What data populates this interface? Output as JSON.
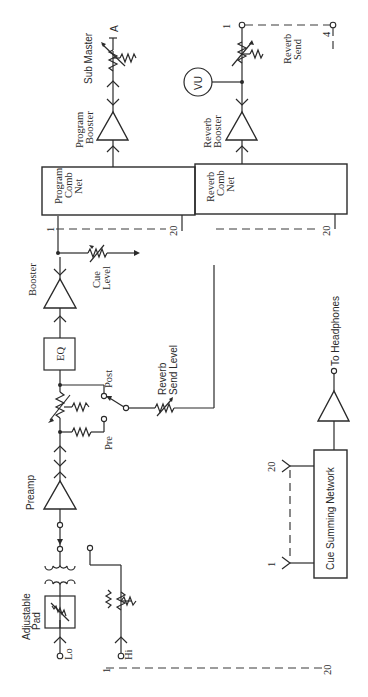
{
  "diagram": {
    "orientation": "rotated-90",
    "labels": {
      "sub_master": "Sub Master",
      "sub_master_out": "A",
      "program_booster_1": "Program",
      "program_booster_2": "Booster",
      "vu": "VU",
      "reverb_send_1": "Reverb",
      "reverb_send_2": "Send",
      "reverb_send_bus_1": "1",
      "reverb_send_bus_4": "4",
      "reverb_booster_1": "Reverb",
      "reverb_booster_2": "Booster",
      "program_comb_1": "Program",
      "program_comb_2": "Comb",
      "program_comb_3": "Net",
      "reverb_comb_1": "Reverb",
      "reverb_comb_2": "Comb",
      "reverb_comb_3": "Net",
      "prog_bus_1": "1",
      "prog_bus_20": "20",
      "rev_bus_20": "20",
      "booster": "Booster",
      "cue_level_1": "Cue",
      "cue_level_2": "Level",
      "eq": "EQ",
      "post": "Post",
      "pre": "Pre",
      "reverb_send_level_1": "Reverb",
      "reverb_send_level_2": "Send Level",
      "preamp": "Preamp",
      "to_headphones": "To Headphones",
      "cue_summing": "Cue Summing Network",
      "cue_in_20": "20",
      "cue_in_1": "1",
      "adjustable_pad_1": "Adjustable",
      "adjustable_pad_2": "Pad",
      "lo": "Lo",
      "hi": "Hi",
      "input_bus_1": "1",
      "input_bus_20": "20"
    },
    "nodes": [
      "Lo input",
      "Hi input",
      "Adjustable Pad",
      "Input transformer",
      "Preamp",
      "Pre/Post fader",
      "EQ",
      "Booster",
      "Cue Level",
      "Reverb Send Level",
      "Program Comb Net",
      "Reverb Comb Net",
      "Program Booster",
      "Sub Master",
      "Reverb Booster",
      "VU",
      "Reverb Send",
      "Cue Summing Network",
      "To Headphones"
    ],
    "colors": {
      "ink": "#2a2a2a",
      "background": "#ffffff"
    }
  }
}
